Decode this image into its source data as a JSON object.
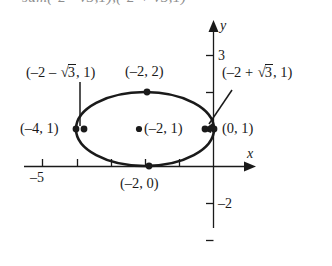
{
  "figure": {
    "kind": "coordinate-plane-with-ellipse",
    "clipped_top_text": "sum(-2 - v3,1),(-2 + v3,1)",
    "axes": {
      "x_axis_label": "x",
      "y_axis_label": "y",
      "x_tick_labels": [
        {
          "text": "-5",
          "value": -5
        }
      ],
      "y_tick_labels": [
        {
          "text": "3",
          "value": 3
        },
        {
          "text": "-2",
          "value": -2
        }
      ],
      "x_range": [
        -6.4,
        1.4
      ],
      "y_range": [
        -2.6,
        3.6
      ],
      "x_ticks": [
        -5,
        -4,
        -3,
        -2,
        -1
      ],
      "y_ticks": [
        3,
        2,
        -2
      ],
      "grid": false
    },
    "ellipse": {
      "center": [
        -2,
        1
      ],
      "semi_axis_x": 2,
      "semi_axis_y": 1
    },
    "points": [
      {
        "id": "left-vertex",
        "text": "(-4, 1)",
        "coords": [
          -4,
          1
        ],
        "dot": true
      },
      {
        "id": "right-vertex",
        "text": "(0, 1)",
        "coords": [
          0,
          1
        ],
        "dot": true
      },
      {
        "id": "top-vertex",
        "text": "(-2, 2)",
        "coords": [
          -2,
          2
        ],
        "dot": true
      },
      {
        "id": "bottom-vertex",
        "text": "(-2, 0)",
        "coords": [
          -2,
          0
        ],
        "dot": true
      },
      {
        "id": "center",
        "text": "(-2, 1)",
        "coords": [
          -2,
          1
        ],
        "dot": true
      },
      {
        "id": "focus-left",
        "text": "(-2 - √3, 1)",
        "coords": [
          -3.732,
          1
        ],
        "dot": true
      },
      {
        "id": "focus-right",
        "text": "(-2 + √3, 1)",
        "coords": [
          -0.268,
          1
        ],
        "dot": true
      }
    ],
    "labels": {
      "focus_left_prefix": "(–2 – ",
      "focus_left_suffix": ", 1)",
      "focus_right_prefix": "(–2 + ",
      "focus_right_suffix": ", 1)",
      "radical_sign": "√",
      "radicand": "3",
      "top_vertex": "(–2, 2)",
      "left_vertex": "(–4, 1)",
      "right_vertex": "(0, 1)",
      "center": "(–2, 1)",
      "bottom_vertex": "(–2, 0)",
      "x_tick_minus5": "–5",
      "y_tick_3": "3",
      "y_tick_minus2": "–2",
      "axis_x": "x",
      "axis_y": "y"
    },
    "colors": {
      "ink": "#1a1a1a",
      "background": "#ffffff",
      "clipped_text": "#8e8e8e"
    }
  }
}
